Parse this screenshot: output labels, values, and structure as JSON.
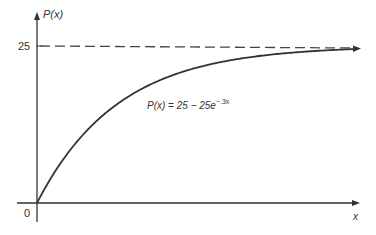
{
  "chart_data": {
    "type": "line",
    "title": "",
    "xlabel": "x",
    "ylabel": "P(x)",
    "y_ticks": [
      {
        "value": 25,
        "label": "25"
      }
    ],
    "origin_label": "0",
    "asymptote": {
      "value": 25,
      "style": "dashed"
    },
    "annotation": {
      "text_main": "P(x) = 25 − 25e",
      "text_exp": "−.3x"
    },
    "function": "P(x) = 25 - 25e^(-0.3x)",
    "x": [
      0,
      1,
      2,
      3,
      4,
      5,
      6,
      8,
      10,
      12,
      15
    ],
    "values": [
      0,
      6.48,
      11.28,
      14.84,
      17.47,
      19.42,
      20.87,
      22.73,
      23.76,
      24.32,
      24.72
    ],
    "grid": false,
    "legend": "none",
    "ylim": [
      0,
      27
    ]
  },
  "colors": {
    "curve": "#333333",
    "axis": "#333333",
    "dash": "#444444"
  }
}
